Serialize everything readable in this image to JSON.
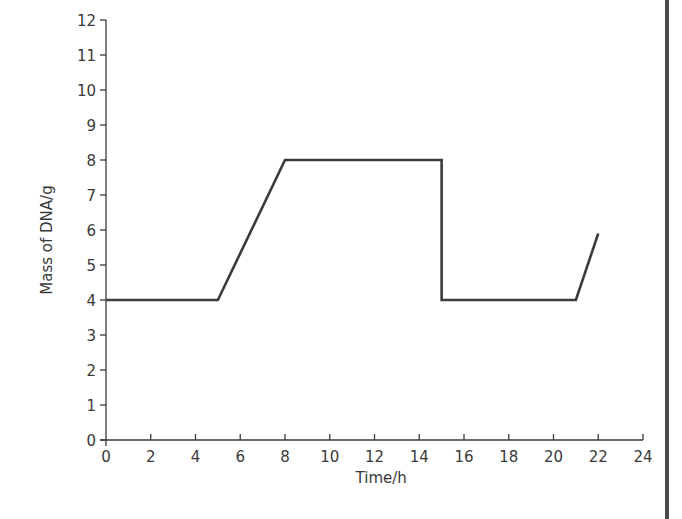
{
  "chart_data": {
    "type": "line",
    "title": "",
    "xlabel": "Time/h",
    "ylabel": "Mass of DNA/g",
    "xlim": [
      0,
      24
    ],
    "ylim": [
      0,
      12
    ],
    "x_ticks": [
      0,
      2,
      4,
      6,
      8,
      10,
      12,
      14,
      16,
      18,
      20,
      22,
      24
    ],
    "y_ticks": [
      0,
      1,
      2,
      3,
      4,
      5,
      6,
      7,
      8,
      9,
      10,
      11,
      12
    ],
    "grid": false,
    "legend": null,
    "series": [
      {
        "name": "Mass of DNA",
        "color": "#3c3c3c",
        "points": [
          {
            "x": 0,
            "y": 4
          },
          {
            "x": 5,
            "y": 4
          },
          {
            "x": 8,
            "y": 8
          },
          {
            "x": 15,
            "y": 8
          },
          {
            "x": 15,
            "y": 4
          },
          {
            "x": 21,
            "y": 4
          },
          {
            "x": 22,
            "y": 5.9
          }
        ]
      }
    ]
  },
  "layout": {
    "origin_px": [
      106,
      440
    ],
    "x_px_per_unit": 22.375,
    "y_px_per_unit": 35,
    "right_border_x": 667
  }
}
